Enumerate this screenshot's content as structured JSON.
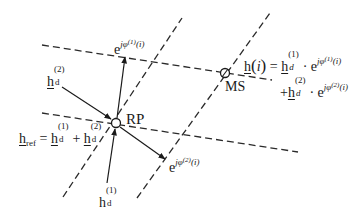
{
  "diagram": {
    "points": {
      "rp": {
        "label": "RP",
        "x": 116,
        "y": 123
      },
      "ms": {
        "label": "MS",
        "x": 225,
        "y": 73
      }
    },
    "labels": {
      "e_phi1": {
        "base": "e",
        "exp_j": "j",
        "exp_phi": "φ",
        "exp_sup": "(1)",
        "exp_arg": "(i)"
      },
      "e_phi2": {
        "base": "e",
        "exp_j": "j",
        "exp_phi": "φ",
        "exp_sup": "(2)",
        "exp_arg": "(i)"
      },
      "hd2": {
        "base": "h",
        "sub": "d",
        "sup": "(2)"
      },
      "hd1": {
        "base": "h",
        "sub": "d",
        "sup": "(1)"
      },
      "href": {
        "lhs_base": "h",
        "lhs_sub": "ref",
        "equals": "=",
        "t1_base": "h",
        "t1_sub": "d",
        "t1_sup": "(1)",
        "plus": "+",
        "t2_base": "h",
        "t2_sub": "d",
        "t2_sup": "(2)"
      },
      "hi": {
        "lhs": "h",
        "lhs_paren_open": "(",
        "lhs_arg": "i",
        "lhs_paren_close": ")",
        "equals": "=",
        "line1_base": "h",
        "line1_sub": "d",
        "line1_sup": "(1)",
        "dot": "·",
        "line1_e": "e",
        "line1_exp": "jφ",
        "line1_exp_sup": "(1)",
        "line1_exp_arg": "(i)",
        "line2_plus": "+",
        "line2_base": "h",
        "line2_sub": "d",
        "line2_sup": "(2)",
        "line2_dot": "·",
        "line2_e": "e",
        "line2_exp": "jφ",
        "line2_exp_sup": "(2)",
        "line2_exp_arg": "(i)"
      }
    },
    "colors": {
      "line": "#1a1a1a",
      "dash": "#2a2a2a",
      "background": "#ffffff"
    }
  }
}
